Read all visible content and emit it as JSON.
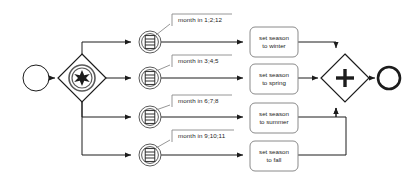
{
  "diagram": {
    "type": "bpmn-process",
    "colors": {
      "stroke": "#1c1c1c",
      "gateway_inner": "#5a5a5a",
      "fill": "#ffffff",
      "annotation": "#6e6e6e",
      "background": "#ffffff"
    },
    "start_event": {
      "name": "start-event",
      "shape": "circle-thin",
      "cx": 36,
      "cy": 78,
      "r": 13
    },
    "split_gateway": {
      "name": "event-based-gateway",
      "shape": "diamond-with-double-circle-star",
      "cx": 82,
      "cy": 78,
      "half": 24,
      "marker": "multiple-event-star"
    },
    "join_gateway": {
      "name": "parallel-gateway",
      "shape": "diamond-with-plus",
      "cx": 345,
      "cy": 78,
      "half": 24,
      "marker": "plus"
    },
    "end_event": {
      "name": "end-event",
      "shape": "circle-thick",
      "cx": 389,
      "cy": 78,
      "r": 11
    },
    "branches": [
      {
        "id": "winter",
        "event_name": "timer-intermediate-event-winter",
        "event": {
          "cx": 150,
          "cy": 42,
          "r": 11
        },
        "annotation": "month in 1;2;12",
        "annotation_x": 172,
        "annotation_y": 15,
        "task": "set season to winter",
        "task_line1": "set season",
        "task_line2": "to winter",
        "task_x": 250,
        "task_y": 27,
        "task_w": 48,
        "task_h": 30
      },
      {
        "id": "spring",
        "event_name": "timer-intermediate-event-spring",
        "event": {
          "cx": 150,
          "cy": 78,
          "r": 11
        },
        "annotation": "month in 3;4;5",
        "annotation_x": 172,
        "annotation_y": 56,
        "task": "set season to spring",
        "task_line1": "set season",
        "task_line2": "to spring",
        "task_x": 250,
        "task_y": 64,
        "task_w": 48,
        "task_h": 30
      },
      {
        "id": "summer",
        "event_name": "timer-intermediate-event-summer",
        "event": {
          "cx": 150,
          "cy": 117,
          "r": 11
        },
        "annotation": "month in 6;7;8",
        "annotation_x": 172,
        "annotation_y": 96,
        "task": "set season to summer",
        "task_line1": "set season",
        "task_line2": "to summer",
        "task_x": 250,
        "task_y": 103,
        "task_w": 48,
        "task_h": 30
      },
      {
        "id": "fall",
        "event_name": "timer-intermediate-event-fall",
        "event": {
          "cx": 150,
          "cy": 155,
          "r": 11
        },
        "annotation": "month in 9;10;11",
        "annotation_x": 172,
        "annotation_y": 131,
        "task": "set season to fall",
        "task_line1": "set season",
        "task_line2": "to fall",
        "task_x": 250,
        "task_y": 141,
        "task_w": 48,
        "task_h": 30
      }
    ]
  }
}
